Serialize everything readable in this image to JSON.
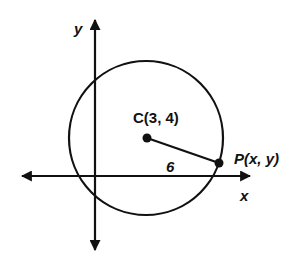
{
  "diagram": {
    "axes": {
      "x_label": "x",
      "y_label": "y"
    },
    "center": {
      "label": "C(3, 4)",
      "x": 3,
      "y": 4
    },
    "point": {
      "label": "P(x, y)"
    },
    "radius": {
      "label": "6",
      "value": 6
    },
    "colors": {
      "stroke": "#111111",
      "background": "#ffffff"
    }
  }
}
